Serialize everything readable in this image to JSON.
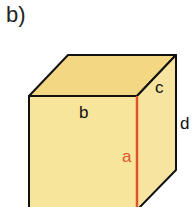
{
  "part_label": "b)",
  "cuboid": {
    "edge_labels": {
      "a": "a",
      "b": "b",
      "c": "c",
      "d": "d"
    },
    "colors": {
      "front": "#f8e59c",
      "top": "#f3d783",
      "side": "#f7e4a0",
      "edge": "#111111",
      "highlight": "#e0532a"
    }
  }
}
